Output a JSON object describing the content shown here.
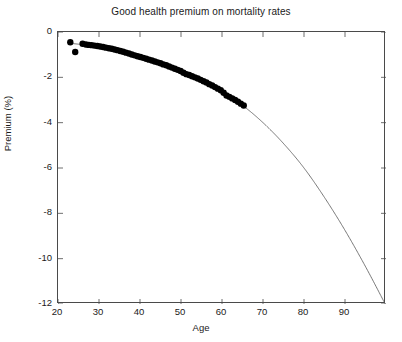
{
  "chart_data": {
    "type": "scatter",
    "title": "Good health premium on mortality rates",
    "xlabel": "Age",
    "ylabel": "Premium (%)",
    "xlim": [
      20,
      100
    ],
    "ylim": [
      -12,
      0
    ],
    "grid": false,
    "legend": null,
    "xticks": [
      20,
      30,
      40,
      50,
      60,
      70,
      80,
      90
    ],
    "xtick_labels": [
      "20",
      "30",
      "40",
      "50",
      "60",
      "70",
      "80",
      "90"
    ],
    "yticks": [
      0,
      -2,
      -4,
      -6,
      -8,
      -10,
      -12
    ],
    "ytick_labels": [
      "0",
      "-2",
      "-4",
      "-6",
      "-8",
      "-10",
      "-12"
    ],
    "series": [
      {
        "name": "Estimated premium (data)",
        "type": "scatter",
        "marker": "filled-circle",
        "color": "#000000",
        "marker_size": 3.2,
        "points": [
          [
            23.0,
            -0.45
          ],
          [
            24.2,
            -0.88
          ],
          [
            26.0,
            -0.52
          ],
          [
            26.8,
            -0.55
          ],
          [
            27.5,
            -0.57
          ],
          [
            28.2,
            -0.58
          ],
          [
            28.9,
            -0.6
          ],
          [
            29.6,
            -0.62
          ],
          [
            30.3,
            -0.64
          ],
          [
            31.0,
            -0.66
          ],
          [
            31.7,
            -0.69
          ],
          [
            32.4,
            -0.72
          ],
          [
            33.1,
            -0.74
          ],
          [
            33.8,
            -0.77
          ],
          [
            34.5,
            -0.8
          ],
          [
            35.2,
            -0.84
          ],
          [
            35.9,
            -0.87
          ],
          [
            36.6,
            -0.91
          ],
          [
            37.3,
            -0.95
          ],
          [
            38.0,
            -0.99
          ],
          [
            38.7,
            -1.03
          ],
          [
            39.4,
            -1.07
          ],
          [
            40.1,
            -1.1
          ],
          [
            40.8,
            -1.14
          ],
          [
            41.5,
            -1.18
          ],
          [
            42.2,
            -1.22
          ],
          [
            42.9,
            -1.26
          ],
          [
            43.6,
            -1.3
          ],
          [
            44.3,
            -1.34
          ],
          [
            45.0,
            -1.38
          ],
          [
            45.7,
            -1.43
          ],
          [
            46.4,
            -1.47
          ],
          [
            47.1,
            -1.52
          ],
          [
            47.8,
            -1.57
          ],
          [
            48.5,
            -1.62
          ],
          [
            49.2,
            -1.67
          ],
          [
            49.9,
            -1.72
          ],
          [
            50.6,
            -1.8
          ],
          [
            51.3,
            -1.86
          ],
          [
            52.0,
            -1.9
          ],
          [
            52.7,
            -1.95
          ],
          [
            53.4,
            -2.0
          ],
          [
            54.1,
            -2.05
          ],
          [
            54.8,
            -2.11
          ],
          [
            55.5,
            -2.17
          ],
          [
            56.2,
            -2.23
          ],
          [
            56.9,
            -2.3
          ],
          [
            57.6,
            -2.36
          ],
          [
            58.3,
            -2.43
          ],
          [
            59.0,
            -2.5
          ],
          [
            59.7,
            -2.57
          ],
          [
            60.4,
            -2.68
          ],
          [
            61.1,
            -2.8
          ],
          [
            61.8,
            -2.86
          ],
          [
            62.5,
            -2.93
          ],
          [
            63.2,
            -3.0
          ],
          [
            63.9,
            -3.08
          ],
          [
            64.6,
            -3.16
          ],
          [
            65.3,
            -3.24
          ]
        ]
      },
      {
        "name": "Fitted extrapolation (curve)",
        "type": "line",
        "color": "#555555",
        "line_width": 0.8,
        "points": [
          [
            23.0,
            -0.5
          ],
          [
            30.0,
            -0.64
          ],
          [
            35.0,
            -0.82
          ],
          [
            40.0,
            -1.08
          ],
          [
            45.0,
            -1.4
          ],
          [
            50.0,
            -1.78
          ],
          [
            55.0,
            -2.2
          ],
          [
            60.0,
            -2.68
          ],
          [
            65.0,
            -3.24
          ],
          [
            70.0,
            -4.0
          ],
          [
            75.0,
            -4.92
          ],
          [
            80.0,
            -6.0
          ],
          [
            85.0,
            -7.3
          ],
          [
            90.0,
            -8.75
          ],
          [
            95.0,
            -10.35
          ],
          [
            99.8,
            -12.0
          ]
        ]
      }
    ]
  }
}
